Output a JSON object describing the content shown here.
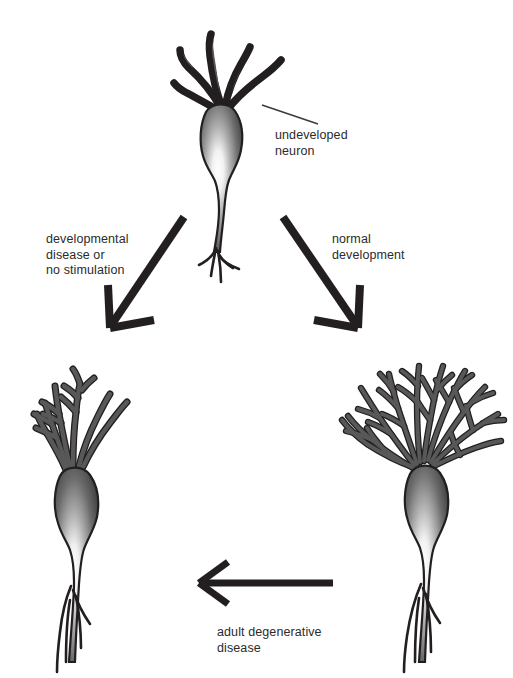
{
  "figure": {
    "background_color": "#ffffff",
    "text_color": "#2b2b2b",
    "arrow_color": "#231f20",
    "neuron_outline_color": "#231f20",
    "neuron_fill_dark": "#4d4d4d",
    "soma_highlight_color": "#ffffff"
  },
  "labels": {
    "undeveloped_neuron": "undeveloped\nneuron",
    "developmental_disease": "developmental\ndisease or\nno stimulation",
    "normal_development": "normal\ndevelopment",
    "adult_degenerative": "adult degenerative\ndisease"
  },
  "nodes": [
    {
      "id": "undeveloped-neuron",
      "name": "undeveloped neuron",
      "position": "top-center",
      "dendrite_count": 5,
      "branching": "none",
      "description": "immature neuron with few short unbranched dendrites"
    },
    {
      "id": "atrophied-neuron",
      "name": "atrophied neuron",
      "position": "bottom-left",
      "dendrite_count": 6,
      "branching": "sparse",
      "description": "neuron with reduced, sparsely branched dendritic tree"
    },
    {
      "id": "mature-neuron",
      "name": "mature neuron",
      "position": "bottom-right",
      "dendrite_count": 9,
      "branching": "dense",
      "description": "mature neuron with extensive dendritic arborization"
    }
  ],
  "arrows": [
    {
      "id": "arrow-to-atrophied",
      "from": "undeveloped-neuron",
      "to": "atrophied-neuron",
      "label_key": "developmental_disease",
      "direction": "down-left"
    },
    {
      "id": "arrow-to-mature",
      "from": "undeveloped-neuron",
      "to": "mature-neuron",
      "label_key": "normal_development",
      "direction": "down-right"
    },
    {
      "id": "arrow-to-degenerate",
      "from": "mature-neuron",
      "to": "atrophied-neuron",
      "label_key": "adult_degenerative",
      "direction": "left"
    }
  ],
  "leader_lines": [
    {
      "id": "leader-undeveloped",
      "target": "undeveloped-neuron",
      "label_key": "undeveloped_neuron"
    }
  ]
}
